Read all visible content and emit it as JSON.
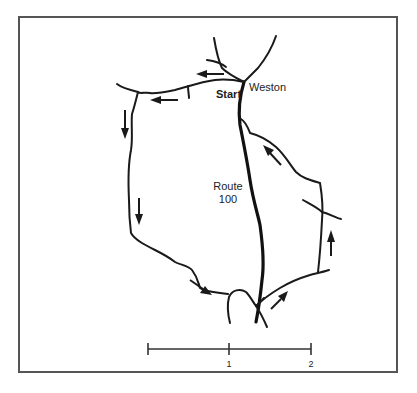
{
  "map": {
    "labels": {
      "start": "Start",
      "town": "Weston",
      "route_line1": "Route",
      "route_line2": "100"
    },
    "scale_bar": {
      "ticks": [
        "",
        "1",
        "2"
      ],
      "unit_note": ""
    },
    "colors": {
      "ink": "#1a1a1a",
      "frame": "#555555",
      "background": "#ffffff"
    },
    "route_direction": "counter-clockwise loop from Start through Weston",
    "arrow_count": 8
  }
}
